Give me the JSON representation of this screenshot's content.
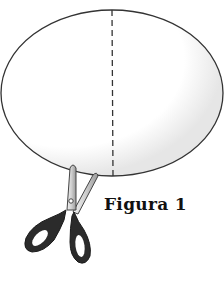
{
  "figure": {
    "caption": "Figura 1",
    "shapes": {
      "ellipse": {
        "cx": 112,
        "cy": 93,
        "rx": 111,
        "ry": 83,
        "stroke": "#333333"
      },
      "fold_line": {
        "x": 112,
        "y1": 10,
        "y2": 176,
        "style": "dashed",
        "stroke": "#333333"
      }
    },
    "icons": {
      "scissors": "scissors-icon"
    },
    "colors": {
      "background": "#ffffff",
      "outline": "#333333",
      "scissor_handles": "#2b2b2b",
      "scissor_blades": "#d9d9d9"
    }
  }
}
